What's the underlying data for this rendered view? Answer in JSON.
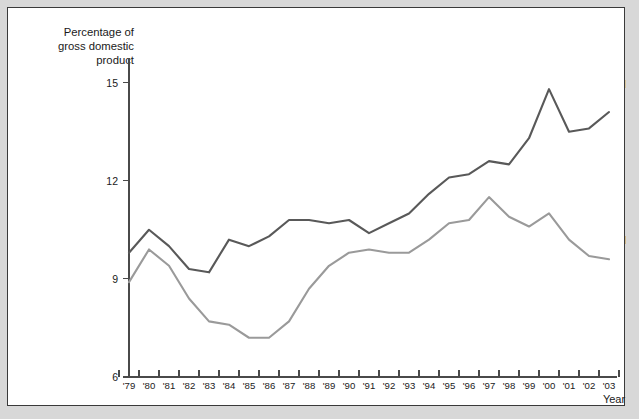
{
  "figure": {
    "y_axis_caption_lines": [
      "Percentage of",
      "gross domestic",
      "product"
    ],
    "x_axis_title": "Year",
    "border_color": "#3a3a3a",
    "background_color": "#ffffff",
    "page_background_color": "#d8d8d8"
  },
  "chart_data": {
    "type": "line",
    "title": "",
    "xlabel": "Year",
    "ylabel": "Percentage of gross domestic product",
    "x": [
      "'79",
      "'80",
      "'81",
      "'82",
      "'83",
      "'84",
      "'85",
      "'86",
      "'87",
      "'88",
      "'89",
      "'90",
      "'91",
      "'92",
      "'93",
      "'94",
      "'95",
      "'96",
      "'97",
      "'98",
      "'99",
      "'00",
      "'01",
      "'02",
      "'03"
    ],
    "x_full_years": [
      1979,
      1980,
      1981,
      1982,
      1983,
      1984,
      1985,
      1986,
      1987,
      1988,
      1989,
      1990,
      1991,
      1992,
      1993,
      1994,
      1995,
      1996,
      1997,
      1998,
      1999,
      2000,
      2001,
      2002,
      2003
    ],
    "ylim": [
      6,
      15.6
    ],
    "yticks": [
      6,
      9,
      12,
      15
    ],
    "ytick_labels": [
      "6",
      "9",
      "12",
      "15"
    ],
    "xlim_index": [
      0,
      24
    ],
    "grid": false,
    "legend_position": "right-inline",
    "series": [
      {
        "name": "Imports",
        "color": "#595959",
        "label_x_index": 24.6,
        "label_y_value": 14.95,
        "values": [
          9.8,
          10.5,
          10.0,
          9.3,
          9.2,
          10.2,
          10.0,
          10.3,
          10.8,
          10.8,
          10.7,
          10.8,
          10.4,
          10.7,
          11.0,
          11.6,
          12.1,
          12.2,
          12.6,
          12.5,
          13.3,
          14.8,
          13.5,
          13.6,
          14.1
        ]
      },
      {
        "name": "Exports",
        "color": "#9a9a9a",
        "label_x_index": 24.6,
        "label_y_value": 10.2,
        "values": [
          8.9,
          9.9,
          9.4,
          8.4,
          7.7,
          7.6,
          7.2,
          7.2,
          7.7,
          8.7,
          9.4,
          9.8,
          9.9,
          9.8,
          9.8,
          10.2,
          10.7,
          10.8,
          11.5,
          10.9,
          10.6,
          11.0,
          10.2,
          9.7,
          9.6
        ]
      }
    ]
  }
}
